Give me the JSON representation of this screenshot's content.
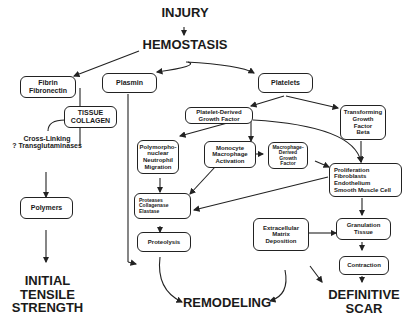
{
  "diagram": {
    "title": "INJURY",
    "stage": "HEMOSTASIS",
    "nodes": {
      "fibrin": "Fibrin\nFibronectin",
      "tissue_collagen": "TISSUE\nCOLLAGEN",
      "cross_linking": "Cross-Linking\n? Transglutaminases",
      "polymers": "Polymers",
      "plasmin": "Plasmin",
      "platelets": "Platelets",
      "pdgf": "Platelet-Derived\nGrowth Factor",
      "tgf": "Transforming\nGrowth\nFactor\nBeta",
      "pmn": "Polymorpho-\nnuclear\nNeutrophil\nMigration",
      "monocyte": "Monocyte\nMacrophage\nActivation",
      "mdgf": "Macrophage-\nDerived\nGrowth\nFactor",
      "proliferation": "Proliferation\n  Fibroblasts\n  Endothelium\n  Smooth Muscle Cell",
      "proteases": "Proteases\n  Collagenase\n  Elastase",
      "proteolysis": "Proteolysis",
      "ecm": "Extracellular\nMatrix\nDeposition",
      "granulation": "Granulation\nTissue",
      "contraction": "Contraction"
    },
    "outcomes": {
      "strength": "INITIAL\nTENSILE\nSTRENGTH",
      "remodeling": "REMODELING",
      "scar": "DEFINITIVE\nSCAR"
    }
  }
}
